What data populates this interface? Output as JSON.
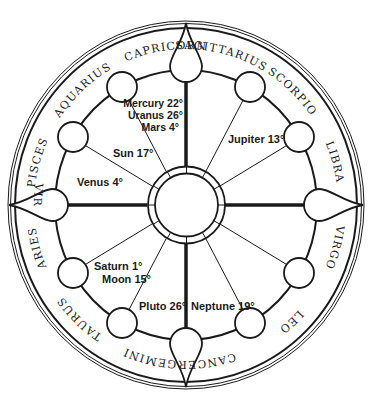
{
  "diagram": {
    "type": "astrological-natal-chart-wheel",
    "colors": {
      "line": "#1a1a1a",
      "background": "#ffffff"
    },
    "signs": [
      {
        "name": "Capricorn",
        "angle": -15
      },
      {
        "name": "Sagittarius",
        "angle": 15
      },
      {
        "name": "Scorpio",
        "angle": 45
      },
      {
        "name": "Libra",
        "angle": 75
      },
      {
        "name": "Virgo",
        "angle": 105
      },
      {
        "name": "Leo",
        "angle": 135
      },
      {
        "name": "Cancer",
        "angle": 165
      },
      {
        "name": "Gemini",
        "angle": 195
      },
      {
        "name": "Taurus",
        "angle": 225
      },
      {
        "name": "Aries",
        "angle": 255
      },
      {
        "name": "Pisces",
        "angle": 285
      },
      {
        "name": "Aquarius",
        "angle": 315
      }
    ],
    "planets": [
      {
        "id": "mercury",
        "label": "Mercury 22°"
      },
      {
        "id": "uranus",
        "label": "Uranus 26°"
      },
      {
        "id": "mars",
        "label": "Mars 4°"
      },
      {
        "id": "jupiter",
        "label": "Jupiter 13°"
      },
      {
        "id": "sun",
        "label": "Sun 17°"
      },
      {
        "id": "venus",
        "label": "Venus 4°"
      },
      {
        "id": "saturn",
        "label": "Saturn 1°"
      },
      {
        "id": "moon",
        "label": "Moon 15°"
      },
      {
        "id": "pluto",
        "label": "Pluto 26°"
      },
      {
        "id": "neptune",
        "label": "Neptune 19°"
      }
    ]
  }
}
